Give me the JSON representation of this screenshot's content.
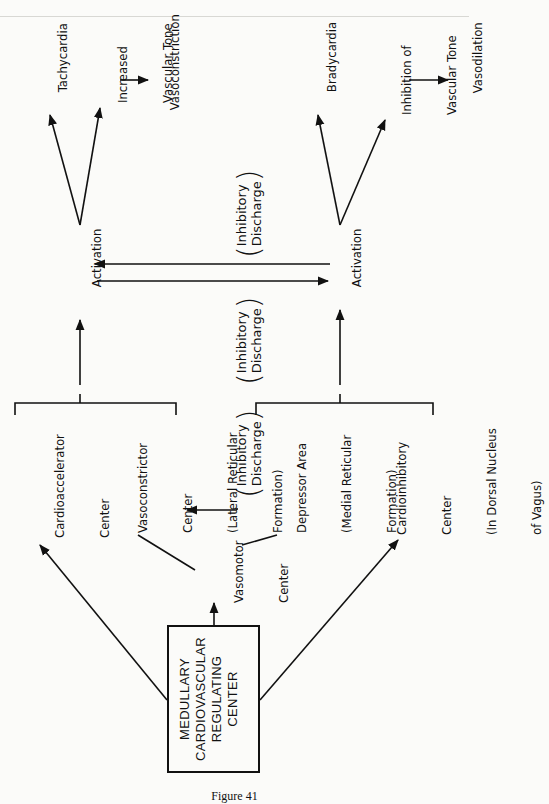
{
  "figure": {
    "caption": "Figure 41",
    "title_box": {
      "lines": [
        "MEDULLARY",
        "CARDIOVASCULAR",
        "REGULATING",
        "CENTER"
      ]
    },
    "nodes": {
      "vasomotor_center": {
        "lines": [
          "Vasomotor",
          "Center"
        ]
      },
      "cardioaccelerator_center": {
        "lines": [
          "Cardioaccelerator",
          "Center"
        ]
      },
      "vasoconstrictor_center": {
        "lines": [
          "Vasoconstrictor",
          "Center",
          "(Lateral Reticular",
          "Formation)"
        ]
      },
      "depressor_area": {
        "lines": [
          "Depressor Area",
          "(Medial Reticular",
          "Formation)"
        ]
      },
      "cardioinhibitory_center": {
        "lines": [
          "Cardioinhibitory",
          "Center",
          "(In Dorsal Nucleus",
          "of Vagus)"
        ]
      },
      "activation_left": {
        "label": "Activation"
      },
      "activation_right": {
        "label": "Activation"
      },
      "tachycardia": {
        "label": "Tachycardia"
      },
      "increased_vascular_tone": {
        "lines": [
          "Increased",
          "Vascular Tone"
        ]
      },
      "vasoconstriction": {
        "label": "Vasoconstriction"
      },
      "bradycardia": {
        "label": "Bradycardia"
      },
      "inhibition_vascular_tone": {
        "lines": [
          "Inhibition of",
          "Vascular Tone"
        ]
      },
      "vasodilation": {
        "label": "Vasodilation"
      }
    },
    "inhibitory_labels": {
      "middle_lower": [
        "Inhibitory",
        "Discharge"
      ],
      "middle_upper_left": [
        "Inhibitory",
        "Discharge"
      ],
      "middle_upper_right": [
        "Inhibitory",
        "Discharge"
      ]
    }
  }
}
